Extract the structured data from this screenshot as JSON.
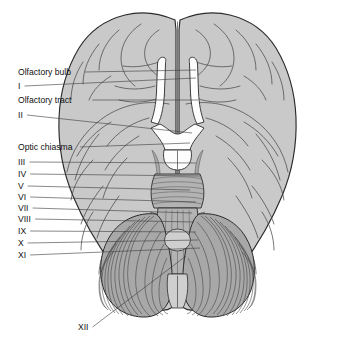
{
  "figure": {
    "background_color": "#ffffff",
    "orientation": "anterior at top, posterior at bottom",
    "view": "inferior surface"
  },
  "palette": {
    "page_background": "#ffffff",
    "cortex_fill": "#c9c9c9",
    "cerebellum_fill": "#a8a8a8",
    "brainstem_fill": "#b3b3b3",
    "white_structure_fill": "#fdfdfd",
    "outline_stroke": "#2b2b2b",
    "sulcus_stroke": "#4a4a4a",
    "leader_stroke": "#3a3a3a",
    "label_text": "#111111"
  },
  "labels": [
    {
      "id": "olfactory-bulb",
      "text": "Olfactory bulb",
      "x": 18,
      "y": 75,
      "leader_to_x": 196,
      "leader_to_y": 70,
      "type": "named"
    },
    {
      "id": "cn-i",
      "text": "I",
      "x": 18,
      "y": 89,
      "leader_to_x": 196,
      "leader_to_y": 78,
      "type": "roman"
    },
    {
      "id": "olfactory-tract",
      "text": "Olfactory tract",
      "x": 18,
      "y": 103,
      "leader_to_x": 198,
      "leader_to_y": 100,
      "type": "named"
    },
    {
      "id": "cn-ii",
      "text": "II",
      "x": 18,
      "y": 118,
      "leader_to_x": 192,
      "leader_to_y": 133,
      "type": "roman"
    },
    {
      "id": "optic-chiasma",
      "text": "Optic chiasma",
      "x": 18,
      "y": 150,
      "leader_to_x": 190,
      "leader_to_y": 143,
      "type": "named"
    },
    {
      "id": "cn-iii",
      "text": "III",
      "x": 18,
      "y": 165,
      "leader_to_x": 196,
      "leader_to_y": 163,
      "type": "roman"
    },
    {
      "id": "cn-iv",
      "text": "IV",
      "x": 18,
      "y": 177,
      "leader_to_x": 200,
      "leader_to_y": 176,
      "type": "roman"
    },
    {
      "id": "cn-v",
      "text": "V",
      "x": 18,
      "y": 189,
      "leader_to_x": 190,
      "leader_to_y": 190,
      "type": "roman"
    },
    {
      "id": "cn-vi",
      "text": "VI",
      "x": 18,
      "y": 200,
      "leader_to_x": 196,
      "leader_to_y": 202,
      "type": "roman"
    },
    {
      "id": "cn-vii",
      "text": "VII",
      "x": 18,
      "y": 211,
      "leader_to_x": 192,
      "leader_to_y": 213,
      "type": "roman"
    },
    {
      "id": "cn-viii",
      "text": "VIII",
      "x": 18,
      "y": 222,
      "leader_to_x": 194,
      "leader_to_y": 222,
      "type": "roman"
    },
    {
      "id": "cn-ix",
      "text": "IX",
      "x": 18,
      "y": 234,
      "leader_to_x": 196,
      "leader_to_y": 232,
      "type": "roman"
    },
    {
      "id": "cn-x",
      "text": "X",
      "x": 18,
      "y": 246,
      "leader_to_x": 198,
      "leader_to_y": 240,
      "type": "roman"
    },
    {
      "id": "cn-xi",
      "text": "XI",
      "x": 18,
      "y": 258,
      "leader_to_x": 200,
      "leader_to_y": 248,
      "type": "roman"
    },
    {
      "id": "cn-xii",
      "text": "XII",
      "x": 78,
      "y": 330,
      "leader_to_x": 186,
      "leader_to_y": 256,
      "type": "roman"
    }
  ],
  "structures": [
    {
      "id": "frontal-lobe-left",
      "name": "Left frontal lobe"
    },
    {
      "id": "frontal-lobe-right",
      "name": "Right frontal lobe"
    },
    {
      "id": "temporal-lobe-left",
      "name": "Left temporal lobe"
    },
    {
      "id": "temporal-lobe-right",
      "name": "Right temporal lobe"
    },
    {
      "id": "occipital-lobe-left",
      "name": "Left occipital lobe"
    },
    {
      "id": "occipital-lobe-right",
      "name": "Right occipital lobe"
    },
    {
      "id": "olfactory-bulb-left",
      "name": "Left olfactory bulb"
    },
    {
      "id": "olfactory-bulb-right",
      "name": "Right olfactory bulb"
    },
    {
      "id": "optic-chiasma",
      "name": "Optic chiasma"
    },
    {
      "id": "mammillary-bodies",
      "name": "Mammillary bodies"
    },
    {
      "id": "pons",
      "name": "Pons"
    },
    {
      "id": "medulla-oblongata",
      "name": "Medulla oblongata"
    },
    {
      "id": "cerebellum-left",
      "name": "Left cerebellar hemisphere"
    },
    {
      "id": "cerebellum-right",
      "name": "Right cerebellar hemisphere"
    },
    {
      "id": "longitudinal-fissure",
      "name": "Longitudinal fissure"
    }
  ]
}
